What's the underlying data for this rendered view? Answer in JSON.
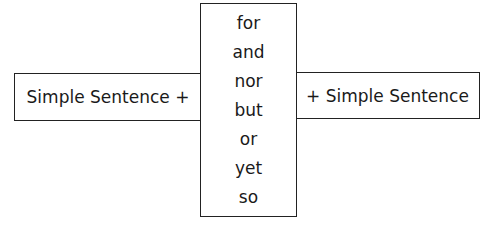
{
  "diagram": {
    "left_box": {
      "label": "Simple Sentence +"
    },
    "center_box": {
      "conjunctions": [
        "for",
        "and",
        "nor",
        "but",
        "or",
        "yet",
        "so"
      ]
    },
    "right_box": {
      "label": "+ Simple Sentence"
    }
  }
}
